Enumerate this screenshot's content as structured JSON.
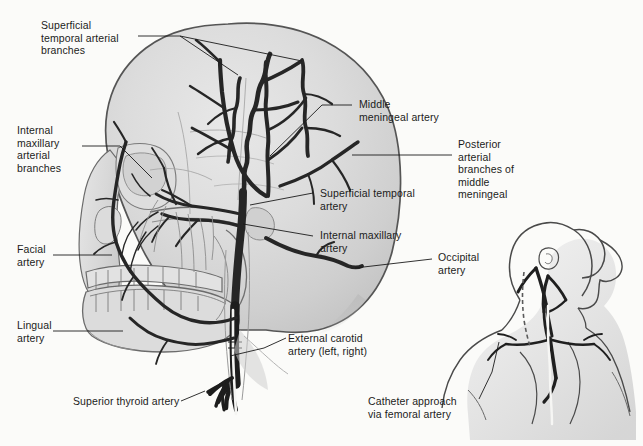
{
  "figure": {
    "background_color": "#fbfbf9",
    "skull_fill_color": "#d6d6d6",
    "skull_outline_color": "#5a5a5a",
    "artery_color": "#2b2b2b",
    "label_text_color": "#1b1b1b",
    "leader_line_color": "#1b1b1b"
  },
  "labels": [
    {
      "id": "superficial-temporal-arterial-branches",
      "text": "Superficial\ntemporal arterial\nbranches",
      "x": 41,
      "y": 19,
      "align": "left"
    },
    {
      "id": "internal-maxillary-arterial-branches",
      "text": "Internal\nmaxillary\narterial\nbranches",
      "x": 17,
      "y": 124,
      "align": "left"
    },
    {
      "id": "facial-artery",
      "text": "Facial\nartery",
      "x": 17,
      "y": 243,
      "align": "left"
    },
    {
      "id": "lingual-artery",
      "text": "Lingual\nartery",
      "x": 17,
      "y": 319,
      "align": "left"
    },
    {
      "id": "superior-thyroid-artery",
      "text": "Superior thyroid artery",
      "x": 73,
      "y": 395,
      "align": "left"
    },
    {
      "id": "middle-meningeal-artery",
      "text": "Middle\nmeningeal artery",
      "x": 359,
      "y": 98,
      "align": "left"
    },
    {
      "id": "superficial-temporal-artery",
      "text": "Superficial temporal\nartery",
      "x": 320,
      "y": 187,
      "align": "left"
    },
    {
      "id": "internal-maxillary-artery",
      "text": "Internal maxillary\nartery",
      "x": 320,
      "y": 229,
      "align": "left"
    },
    {
      "id": "posterior-arterial-branches-of-middle-meningeal",
      "text": "Posterior\narterial\nbranches of\nmiddle\nmeningeal",
      "x": 458,
      "y": 138,
      "align": "left"
    },
    {
      "id": "occipital-artery",
      "text": "Occipital\nartery",
      "x": 438,
      "y": 251,
      "align": "left"
    },
    {
      "id": "external-carotid-artery",
      "text": "External carotid\nartery (left, right)",
      "x": 288,
      "y": 332,
      "align": "left"
    },
    {
      "id": "catheter-approach-via-femoral-artery",
      "text": "Catheter approach\nvia femoral artery",
      "x": 368,
      "y": 395,
      "align": "left"
    }
  ],
  "leader_lines": [
    {
      "id": "leader-superficial-temporal-branches-a",
      "points": "138,36 180,36 238,75"
    },
    {
      "id": "leader-superficial-temporal-branches-b",
      "points": "180,36 300,60"
    },
    {
      "id": "leader-internal-maxillary-branches",
      "points": "82,146 120,146 152,178"
    },
    {
      "id": "leader-facial-artery",
      "points": "53,255 112,255"
    },
    {
      "id": "leader-lingual-artery",
      "points": "53,331 123,331"
    },
    {
      "id": "leader-superior-thyroid-artery",
      "points": "181,401 208,390"
    },
    {
      "id": "leader-middle-meningeal-artery",
      "points": "352,105 322,105 270,155"
    },
    {
      "id": "leader-superficial-temporal-artery",
      "points": "313,193 250,205"
    },
    {
      "id": "leader-internal-maxillary-artery",
      "points": "313,236 243,224"
    },
    {
      "id": "leader-posterior-branches",
      "points": "452,155 352,155"
    },
    {
      "id": "leader-occipital-artery",
      "points": "432,259 355,268"
    },
    {
      "id": "leader-external-carotid",
      "points": "286,338 266,348 232,355"
    },
    {
      "id": "leader-catheter-approach",
      "points": "481,398 492,372 498,343"
    }
  ],
  "inset": {
    "id": "catheter-approach-inset",
    "description": "Lateral head, neck and shoulder silhouette showing carotid vessels and white catheter ascending from aortic arch"
  },
  "structures": [
    {
      "id": "cranium",
      "name": "skull-cranium"
    },
    {
      "id": "facial-bones",
      "name": "facial-skeleton"
    },
    {
      "id": "mandible",
      "name": "mandible"
    },
    {
      "id": "maxillary-teeth",
      "name": "upper-dentition"
    },
    {
      "id": "mandibular-teeth",
      "name": "lower-dentition"
    },
    {
      "id": "external-carotid-trunk",
      "name": "external-carotid-trunk"
    },
    {
      "id": "superficial-temporal-trunk",
      "name": "superficial-temporal-artery-trunk"
    },
    {
      "id": "middle-meningeal-trunk",
      "name": "middle-meningeal-artery-trunk"
    },
    {
      "id": "occipital-trunk",
      "name": "occipital-artery-trunk"
    },
    {
      "id": "facial-artery-trunk",
      "name": "facial-artery-trunk"
    },
    {
      "id": "lingual-artery-trunk",
      "name": "lingual-artery-trunk"
    },
    {
      "id": "superior-thyroid-trunk",
      "name": "superior-thyroid-artery-trunk"
    },
    {
      "id": "catheter",
      "name": "catheter-line"
    }
  ]
}
